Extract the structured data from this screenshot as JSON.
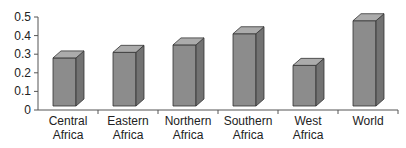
{
  "chart_data": {
    "type": "bar",
    "style": "3d-column",
    "title": "",
    "xlabel": "",
    "ylabel": "",
    "categories": [
      "Central Africa",
      "Eastern Africa",
      "Northern Africa",
      "Southern Africa",
      "West Africa",
      "World"
    ],
    "category_lines": [
      [
        "Central",
        "Africa"
      ],
      [
        "Eastern",
        "Africa"
      ],
      [
        "Northern",
        "Africa"
      ],
      [
        "Southern",
        "Africa"
      ],
      [
        "West",
        "Africa"
      ],
      [
        "World"
      ]
    ],
    "values": [
      0.28,
      0.31,
      0.35,
      0.41,
      0.24,
      0.48
    ],
    "ylim": [
      0,
      0.5
    ],
    "yticks": [
      0,
      0.1,
      0.2,
      0.3,
      0.4,
      0.5
    ],
    "ytick_labels": [
      "0",
      "0.1",
      "0.2",
      "0.3",
      "0.4",
      "0.5"
    ],
    "grid": false,
    "legend": null,
    "colors": {
      "front": "#8c8c8c",
      "side": "#727272",
      "top": "#ababab",
      "edge": "#333333",
      "axis": "#555555"
    }
  }
}
